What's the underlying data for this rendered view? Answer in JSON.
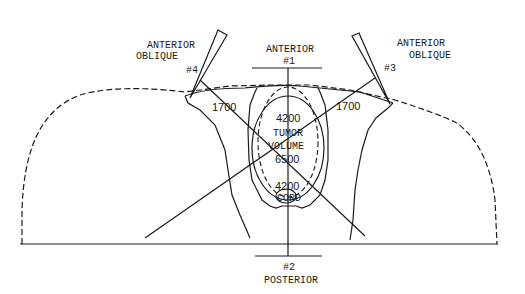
{
  "diagram": {
    "type": "radiotherapy isodose plan (cross-section)",
    "beams": [
      {
        "id": "#1",
        "name": "ANTERIOR",
        "label_line1": "ANTERIOR",
        "number": "#1"
      },
      {
        "id": "#2",
        "name": "POSTERIOR",
        "label_line1": "POSTERIOR",
        "number": "#2"
      },
      {
        "id": "#3",
        "name": "ANTERIOR OBLIQUE",
        "label_line1": "ANTERIOR",
        "label_line2": "OBLIQUE",
        "number": "#3"
      },
      {
        "id": "#4",
        "name": "ANTERIOR OBLIQUE",
        "label_line1": "ANTERIOR",
        "label_line2": "OBLIQUE",
        "number": "#4"
      }
    ],
    "isodose": {
      "left_1700": "1700",
      "right_1700": "1700",
      "top_4200": "4200",
      "bottom_4200": "4200",
      "tumor_6500": "6500"
    },
    "structures": {
      "tumor_line1": "TUMOR",
      "tumor_line2": "VOLUME",
      "cord": "CORD"
    },
    "colors": {
      "ink": "#1a1a1a",
      "background": "#ffffff"
    }
  }
}
